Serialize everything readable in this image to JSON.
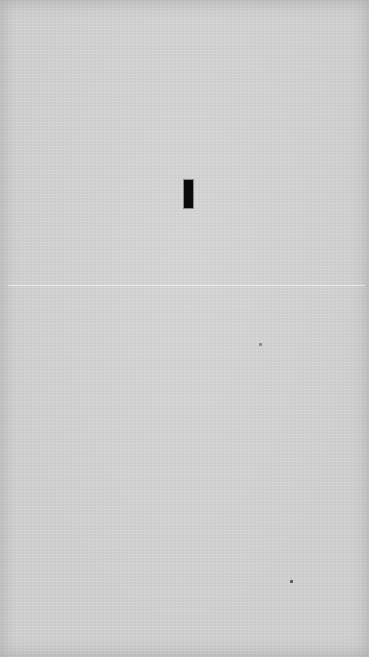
{
  "surface": {
    "kind": "blank paper",
    "background_color": "#d3d3d3"
  },
  "marks": {
    "cursor_bar": {
      "color": "#0a0a0a",
      "x": 184,
      "y": 180,
      "width": 9,
      "height": 28
    },
    "crease": {
      "y": 285
    },
    "specks": [
      {
        "x": 290,
        "y": 580
      },
      {
        "x": 259,
        "y": 343
      }
    ]
  }
}
